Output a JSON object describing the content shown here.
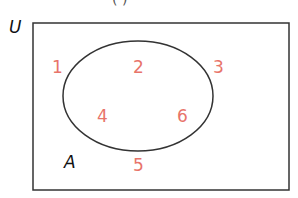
{
  "diagram": {
    "type": "venn",
    "universal_label": "U",
    "set_label": "A",
    "top_fragment": "(          )",
    "colors": {
      "element": "#e8746a",
      "outline": "#333333",
      "label": "#111111"
    },
    "elements_outside": [
      "1",
      "3",
      "5"
    ],
    "elements_inside_A": [
      "2",
      "4",
      "6"
    ],
    "elements": [
      {
        "value": "1",
        "in_A": false
      },
      {
        "value": "2",
        "in_A": true
      },
      {
        "value": "3",
        "in_A": false
      },
      {
        "value": "4",
        "in_A": true
      },
      {
        "value": "6",
        "in_A": true
      },
      {
        "value": "5",
        "in_A": false
      }
    ]
  }
}
